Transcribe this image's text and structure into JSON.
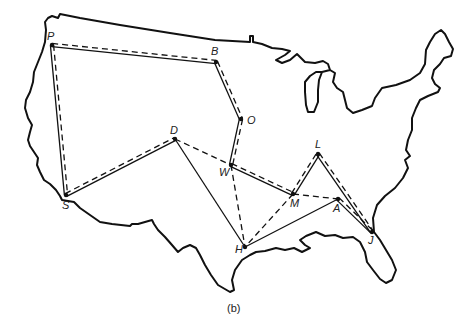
{
  "figure": {
    "caption": "(b)"
  },
  "nodes": [
    {
      "id": "P",
      "label": "P",
      "x": 52,
      "y": 45,
      "lx": 47,
      "ly": 40
    },
    {
      "id": "B",
      "label": "B",
      "x": 216,
      "y": 62,
      "lx": 211,
      "ly": 55
    },
    {
      "id": "O",
      "label": "O",
      "x": 241,
      "y": 119,
      "lx": 247,
      "ly": 124
    },
    {
      "id": "D",
      "label": "D",
      "x": 175,
      "y": 139,
      "lx": 170,
      "ly": 134
    },
    {
      "id": "W",
      "label": "W",
      "x": 231,
      "y": 165,
      "lx": 219,
      "ly": 176
    },
    {
      "id": "S",
      "label": "S",
      "x": 66,
      "y": 195,
      "lx": 62,
      "ly": 209
    },
    {
      "id": "L",
      "label": "L",
      "x": 318,
      "y": 154,
      "lx": 315,
      "ly": 148
    },
    {
      "id": "M",
      "label": "M",
      "x": 293,
      "y": 194,
      "lx": 290,
      "ly": 207
    },
    {
      "id": "A",
      "label": "A",
      "x": 338,
      "y": 199,
      "lx": 333,
      "ly": 212
    },
    {
      "id": "J",
      "label": "J",
      "x": 372,
      "y": 232,
      "lx": 368,
      "ly": 244
    },
    {
      "id": "H",
      "label": "H",
      "x": 245,
      "y": 247,
      "lx": 235,
      "ly": 253
    }
  ],
  "edges": [
    {
      "from": "P",
      "to": "B",
      "style": "double"
    },
    {
      "from": "P",
      "to": "S",
      "style": "double"
    },
    {
      "from": "B",
      "to": "O",
      "style": "double"
    },
    {
      "from": "O",
      "to": "W",
      "style": "double"
    },
    {
      "from": "S",
      "to": "D",
      "style": "double"
    },
    {
      "from": "W",
      "to": "M",
      "style": "double"
    },
    {
      "from": "M",
      "to": "L",
      "style": "double"
    },
    {
      "from": "L",
      "to": "J",
      "style": "double"
    },
    {
      "from": "A",
      "to": "J",
      "style": "double"
    },
    {
      "from": "D",
      "to": "W",
      "style": "dashed"
    },
    {
      "from": "W",
      "to": "H",
      "style": "dashed"
    },
    {
      "from": "M",
      "to": "H",
      "style": "dashed"
    },
    {
      "from": "M",
      "to": "A",
      "style": "dashed"
    },
    {
      "from": "D",
      "to": "H",
      "style": "solid"
    },
    {
      "from": "A",
      "to": "H",
      "style": "solid"
    }
  ],
  "legend_styles": {
    "solid": "solid line",
    "dashed": "dashed line",
    "double": "solid + dashed parallel lines"
  },
  "colors": {
    "ink": "#111111",
    "background": "#ffffff"
  }
}
